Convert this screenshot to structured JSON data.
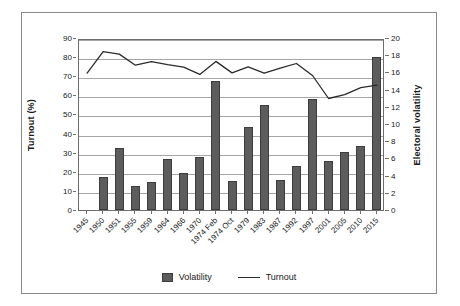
{
  "chart_data": {
    "type": "bar",
    "title": "",
    "subtitle": "",
    "xlabel": "",
    "ylabel": "Turnout (%)",
    "y2label": "Electoral volatility",
    "ylim": [
      0,
      90
    ],
    "y2lim": [
      0,
      20
    ],
    "yticks": [
      0,
      10,
      20,
      30,
      40,
      50,
      60,
      70,
      80,
      90
    ],
    "y2ticks": [
      0,
      2,
      4,
      6,
      8,
      10,
      12,
      14,
      16,
      18,
      20
    ],
    "grid": true,
    "legend_position": "bottom",
    "categories": [
      "1945",
      "1950",
      "1951",
      "1955",
      "1959",
      "1964",
      "1966",
      "1970",
      "1974 Feb",
      "1974 Oct",
      "1979",
      "1983",
      "1987",
      "1992",
      "1997",
      "2001",
      "2005",
      "2010",
      "2015"
    ],
    "series": [
      {
        "name": "Volatility",
        "kind": "bar",
        "axis": "right",
        "color": "#5c5c5c",
        "values": [
          null,
          3.9,
          7.2,
          2.8,
          3.3,
          5.9,
          4.3,
          6.2,
          15.0,
          3.4,
          9.7,
          12.2,
          3.5,
          5.1,
          12.9,
          5.7,
          6.8,
          7.4,
          17.8
        ]
      },
      {
        "name": "Turnout",
        "kind": "line",
        "axis": "left",
        "color": "#2b2b2b",
        "values": [
          72.7,
          83.9,
          82.6,
          76.8,
          78.7,
          77.1,
          75.8,
          72.0,
          78.8,
          72.8,
          76.0,
          72.7,
          75.3,
          77.7,
          71.4,
          59.4,
          61.4,
          65.1,
          66.4
        ]
      }
    ],
    "legend": [
      {
        "label": "Volatility",
        "marker": "square",
        "color": "#5c5c5c"
      },
      {
        "label": "Turnout",
        "marker": "line",
        "color": "#2b2b2b"
      }
    ]
  },
  "axes": {
    "left_title": "Turnout (%)",
    "right_title": "Electoral volatility"
  }
}
